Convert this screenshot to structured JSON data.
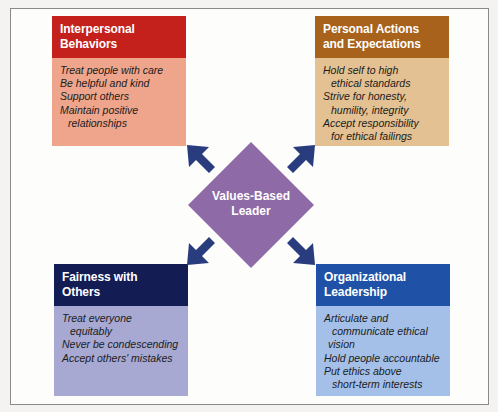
{
  "center": {
    "label_line1": "Values-Based",
    "label_line2": "Leader",
    "color": "#8e6aa6"
  },
  "arrow_color": "#283c7e",
  "boxes": {
    "top_left": {
      "title_line1": "Interpersonal",
      "title_line2": "Behaviors",
      "header_color": "#c4201c",
      "body_color": "#eea58c",
      "items": [
        "Treat people with care",
        "Be helpful and kind",
        "Support others",
        "Maintain positive",
        "relationships"
      ]
    },
    "top_right": {
      "title_line1": "Personal Actions",
      "title_line2": "and Expectations",
      "header_color": "#a8621c",
      "body_color": "#e3c193",
      "items": [
        "Hold self to high",
        "ethical standards",
        "Strive for honesty,",
        "humility, integrity",
        "Accept responsibility",
        "for ethical failings"
      ]
    },
    "bottom_left": {
      "title_line1": "Fairness with",
      "title_line2": "Others",
      "header_color": "#141c54",
      "body_color": "#a7a9d3",
      "items": [
        "Treat everyone",
        "equitably",
        "Never be condescending",
        "Accept others' mistakes"
      ]
    },
    "bottom_right": {
      "title_line1": "Organizational",
      "title_line2": "Leadership",
      "header_color": "#1f52a6",
      "body_color": "#a5c0e8",
      "items": [
        "Articulate and",
        "communicate ethical",
        "vision",
        "Hold people accountable",
        "Put ethics above",
        "short-term interests"
      ]
    }
  }
}
